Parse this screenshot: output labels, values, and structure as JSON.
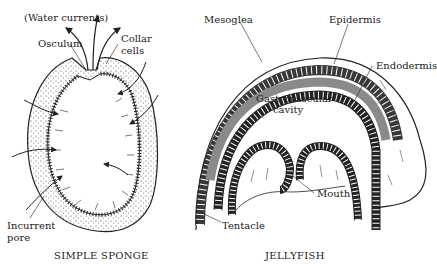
{
  "figure": {
    "panels": [
      {
        "id": "sponge",
        "caption": "SIMPLE SPONGE",
        "labels": {
          "water_currents": "(Water currents)",
          "osculum": "Osculum",
          "collar_cells_line1": "Collar",
          "collar_cells_line2": "cells",
          "incurrent_pore_line1": "Incurrent",
          "incurrent_pore_line2": "pore"
        }
      },
      {
        "id": "jellyfish",
        "caption": "JELLYFISH",
        "labels": {
          "mesoglea": "Mesoglea",
          "epidermis": "Epidermis",
          "endodermis": "Endodermis",
          "gastro_line1": "Gastrovascular",
          "gastro_line2": "cavity",
          "mouth": "Mouth",
          "tentacle": "Tentacle"
        }
      }
    ],
    "colors": {
      "ink": "#222222",
      "mesoglea": "#8a8a8a",
      "background": "#ffffff"
    }
  }
}
